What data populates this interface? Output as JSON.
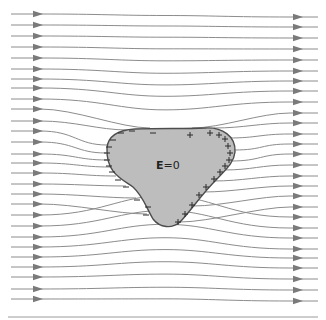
{
  "figure": {
    "label": {
      "symbol": "E",
      "equals": "=0"
    },
    "colors": {
      "field_line": "#8c8c8c",
      "arrow": "#7a7a7a",
      "conductor_fill": "#bdbdbd",
      "conductor_outline": "#4d4d4d",
      "charge_sign": "#2b2b2b",
      "baseline": "#9a9a9a"
    },
    "negative_charges": [
      [
        121,
        133
      ],
      [
        132,
        131
      ],
      [
        153,
        133
      ],
      [
        113,
        140
      ],
      [
        109,
        147
      ],
      [
        107,
        153
      ],
      [
        107,
        160
      ],
      [
        109,
        166
      ],
      [
        112,
        172
      ],
      [
        118,
        180
      ],
      [
        126,
        187
      ],
      [
        137,
        200
      ],
      [
        146,
        215
      ],
      [
        148,
        207
      ]
    ],
    "positive_charges": [
      [
        190,
        135
      ],
      [
        210,
        133
      ],
      [
        219,
        135
      ],
      [
        225,
        139
      ],
      [
        228,
        146
      ],
      [
        230,
        153
      ],
      [
        229,
        160
      ],
      [
        225,
        166
      ],
      [
        220,
        172
      ],
      [
        214,
        179
      ],
      [
        206,
        187
      ],
      [
        199,
        195
      ],
      [
        192,
        205
      ],
      [
        185,
        214
      ],
      [
        178,
        222
      ]
    ],
    "left_ys": [
      14,
      25,
      36,
      47,
      58,
      69,
      79,
      88,
      99,
      109,
      121,
      131,
      142,
      154,
      163,
      173,
      184,
      194,
      204,
      215,
      226,
      237,
      247,
      257,
      267,
      277,
      289,
      299
    ],
    "right_ys": [
      17,
      27,
      38,
      49,
      60,
      71,
      81,
      91,
      102,
      113,
      123,
      134,
      144,
      154,
      165,
      176,
      186,
      196,
      207,
      217,
      228,
      238,
      249,
      258,
      268,
      279,
      290,
      301
    ]
  }
}
